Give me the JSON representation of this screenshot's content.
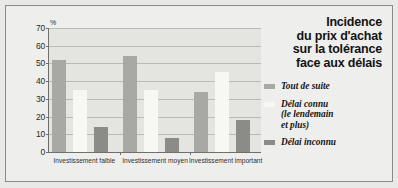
{
  "panel": {
    "title_lines": [
      "Incidence",
      "du prix d'achat",
      "sur la tolérance",
      "face aux délais"
    ],
    "legend": [
      {
        "label_lines": [
          "Tout de suite"
        ],
        "color": "#a8a8a4"
      },
      {
        "label_lines": [
          "Délai connu",
          "(le lendemain",
          "et plus)"
        ],
        "color": "#f7f7f4"
      },
      {
        "label_lines": [
          "Délai inconnu"
        ],
        "color": "#8b8b87"
      }
    ]
  },
  "chart_data": {
    "type": "bar",
    "xlabel": "",
    "ylabel": "%",
    "ylim": [
      0,
      70
    ],
    "yticks": [
      0,
      10,
      20,
      30,
      40,
      50,
      60,
      70
    ],
    "grid": true,
    "legend_position": "right",
    "categories": [
      "Investissement faible",
      "Investissement moyen",
      "Investissement important"
    ],
    "series": [
      {
        "name": "Tout de suite",
        "color": "#a8a8a4",
        "values": [
          52,
          54,
          34
        ]
      },
      {
        "name": "Délai connu (le lendemain et plus)",
        "color": "#f7f7f4",
        "values": [
          35,
          35,
          45
        ]
      },
      {
        "name": "Délai inconnu",
        "color": "#8b8b87",
        "values": [
          14,
          8,
          18
        ]
      }
    ]
  }
}
